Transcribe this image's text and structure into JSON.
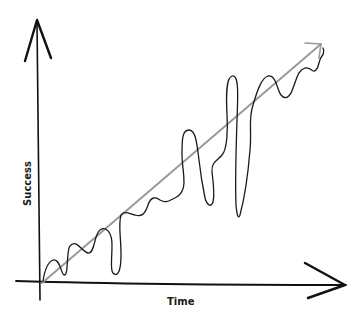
{
  "diagram": {
    "title": "",
    "x_axis": {
      "label": "Time"
    },
    "y_axis": {
      "label": "Success"
    },
    "series": [
      {
        "name": "trend",
        "description": "straight diagonal arrow rising from origin to top-right",
        "color": "#999999"
      },
      {
        "name": "actual-path",
        "description": "wavy, looping hand-drawn line oscillating around the trend",
        "color": "#1a1a1a"
      }
    ],
    "colors": {
      "axis": "#111111",
      "trend": "#999999",
      "path": "#1a1a1a",
      "background": "#ffffff"
    }
  }
}
